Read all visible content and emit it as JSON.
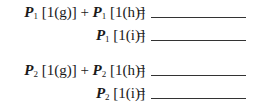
{
  "equations": [
    {
      "terms": [
        {
          "var": "P",
          "sub": "1",
          "arg": "[1(g)]"
        },
        {
          "var": "P",
          "sub": "1",
          "arg": "[1(h)]"
        }
      ],
      "op": "+",
      "equals": "=",
      "answer": ""
    },
    {
      "terms": [
        {
          "var": "P",
          "sub": "1",
          "arg": "[1(i)]"
        }
      ],
      "equals": "=",
      "answer": ""
    },
    {
      "terms": [
        {
          "var": "P",
          "sub": "2",
          "arg": "[1(g)]"
        },
        {
          "var": "P",
          "sub": "2",
          "arg": "[1(h)]"
        }
      ],
      "op": "+",
      "equals": "=",
      "answer": ""
    },
    {
      "terms": [
        {
          "var": "P",
          "sub": "2",
          "arg": "[1(i)]"
        }
      ],
      "equals": "=",
      "answer": ""
    }
  ]
}
